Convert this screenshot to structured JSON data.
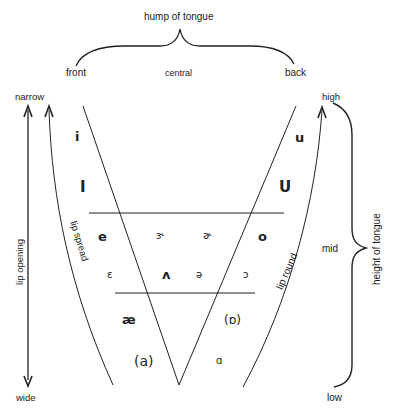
{
  "top": {
    "title": "hump of tongue",
    "positions": [
      "front",
      "central",
      "back"
    ]
  },
  "left": {
    "top_label": "narrow",
    "bottom_label": "wide",
    "axis_label": "lip opening",
    "curve_label": "lip spread"
  },
  "right": {
    "top_label": "high",
    "middle_label": "mid",
    "bottom_label": "low",
    "axis_label": "height of tongue",
    "curve_label": "lip round"
  },
  "vowels": {
    "high_front_tense": "i",
    "high_front_lax": "I",
    "high_back_tense": "u",
    "high_back_lax": "U",
    "mid_front_tense": "e",
    "mid_central_stressed_r": "ɝ",
    "mid_central_unstressed_r": "ɚ",
    "mid_back_tense": "o",
    "mid_front_lax": "ɛ",
    "mid_central_stressed": "ʌ",
    "mid_central_schwa": "ə",
    "mid_back_lax": "ɔ",
    "low_front": "æ",
    "low_back_rounded": "(ɒ)",
    "low_central": "(a)",
    "low_back": "ɑ"
  }
}
